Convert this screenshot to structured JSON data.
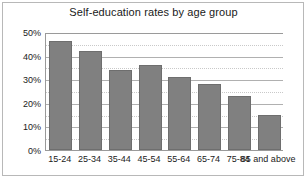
{
  "chart_data": {
    "type": "bar",
    "title": "Self-education rates by age group",
    "xlabel": "",
    "ylabel": "",
    "categories": [
      "15-24",
      "25-34",
      "35-44",
      "45-54",
      "55-64",
      "65-74",
      "75-84",
      "85 and above"
    ],
    "values": [
      46,
      42,
      34,
      36,
      31,
      28,
      23,
      15
    ],
    "ylim": [
      0,
      50
    ],
    "ytick_labels": [
      "0%",
      "10%",
      "20%",
      "30%",
      "40%",
      "50%"
    ],
    "ytick_values": [
      0,
      10,
      20,
      30,
      40,
      50
    ],
    "minor_tick_values": [
      5,
      15,
      25,
      35,
      45
    ],
    "grid": "horizontal major solid, horizontal minor dotted",
    "legend": "none",
    "bar_color": "#808080",
    "bar_border_color": "#6e6e6e",
    "gridline_color": "#b0b0b0",
    "minor_gridline_color": "#c9c9c9",
    "axis_color": "#9a9a9a",
    "frame_color": "#b8b8b8",
    "background_color": "#ffffff",
    "text_color": "#1a1a1a"
  }
}
